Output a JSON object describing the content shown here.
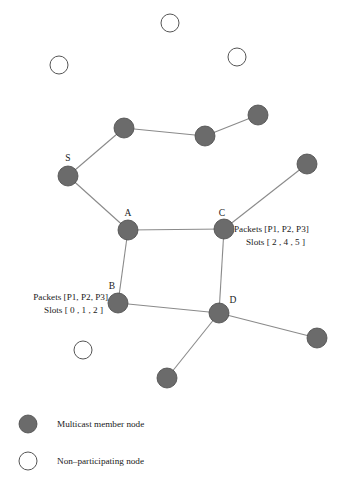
{
  "figure": {
    "background_color": "#ffffff",
    "member_node_color": "#6b6b6b",
    "member_node_stroke": "#4a4a4a",
    "nonmember_node_fill": "#ffffff",
    "nonmember_node_stroke": "#555555",
    "edge_color": "#8a8a8a",
    "text_color": "#1a1a1a"
  },
  "nodes": {
    "members": [
      {
        "id": "n1",
        "label": "",
        "x": 124,
        "y": 128,
        "r": 10
      },
      {
        "id": "n2",
        "label": "",
        "x": 205,
        "y": 136,
        "r": 10
      },
      {
        "id": "n3",
        "label": "",
        "x": 258,
        "y": 115,
        "r": 10
      },
      {
        "id": "S",
        "label": "S",
        "x": 68,
        "y": 176,
        "r": 10,
        "label_x": 68,
        "label_y": 161
      },
      {
        "id": "n4",
        "label": "",
        "x": 307,
        "y": 164,
        "r": 10
      },
      {
        "id": "A",
        "label": "A",
        "x": 128,
        "y": 230,
        "r": 10,
        "label_x": 128,
        "label_y": 216
      },
      {
        "id": "C",
        "label": "C",
        "x": 224,
        "y": 229,
        "r": 10,
        "label_x": 222,
        "label_y": 216
      },
      {
        "id": "B",
        "label": "B",
        "x": 118,
        "y": 303,
        "r": 10,
        "label_x": 112,
        "label_y": 289
      },
      {
        "id": "D",
        "label": "D",
        "x": 219,
        "y": 313,
        "r": 10,
        "label_x": 233,
        "label_y": 303
      },
      {
        "id": "n5",
        "label": "",
        "x": 317,
        "y": 338,
        "r": 10
      },
      {
        "id": "n6",
        "label": "",
        "x": 167,
        "y": 378,
        "r": 10
      }
    ],
    "nonmembers": [
      {
        "id": "w1",
        "x": 170,
        "y": 23,
        "r": 9
      },
      {
        "id": "w2",
        "x": 59,
        "y": 65,
        "r": 9
      },
      {
        "id": "w3",
        "x": 237,
        "y": 57,
        "r": 9
      },
      {
        "id": "w4",
        "x": 83,
        "y": 350,
        "r": 9
      }
    ]
  },
  "edges": [
    {
      "from": "S",
      "to": "n1"
    },
    {
      "from": "n1",
      "to": "n2"
    },
    {
      "from": "n2",
      "to": "n3"
    },
    {
      "from": "S",
      "to": "A"
    },
    {
      "from": "A",
      "to": "C"
    },
    {
      "from": "C",
      "to": "n4"
    },
    {
      "from": "A",
      "to": "B"
    },
    {
      "from": "C",
      "to": "D"
    },
    {
      "from": "B",
      "to": "D"
    },
    {
      "from": "D",
      "to": "n5"
    },
    {
      "from": "D",
      "to": "n6"
    }
  ],
  "annotations": [
    {
      "id": "annot-c",
      "anchor": "C",
      "align": "start",
      "x": 234,
      "lines": [
        {
          "text": "Packets [P1, P2, P3]",
          "y": 232
        },
        {
          "text": "Slots [  2 ,  4 ,  5 ]",
          "y": 245,
          "x": 246
        }
      ]
    },
    {
      "id": "annot-b",
      "anchor": "B",
      "align": "end",
      "x": 108,
      "lines": [
        {
          "text": "Packets [P1, P2, P3]",
          "y": 300
        },
        {
          "text": "Slots [  0 ,  1 ,  2 ]",
          "y": 313,
          "x": 103
        }
      ]
    }
  ],
  "legend": {
    "items": [
      {
        "id": "legend-member",
        "marker": "filled-circle",
        "label": "Multicast member node",
        "marker_x": 28,
        "marker_y": 424,
        "r": 9,
        "text_x": 57,
        "text_y": 425
      },
      {
        "id": "legend-nonmember",
        "marker": "open-circle",
        "label": "Non–participating node",
        "marker_x": 28,
        "marker_y": 461,
        "r": 9,
        "text_x": 57,
        "text_y": 462
      }
    ]
  }
}
